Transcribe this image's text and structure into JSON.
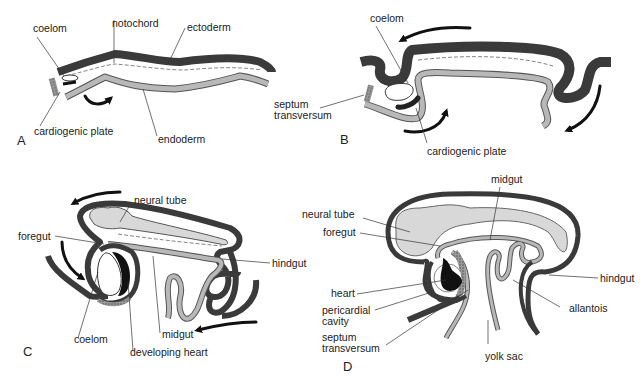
{
  "diagram": {
    "colors": {
      "ectoderm": "#3a3a3a",
      "endoderm_fill": "#b8b8b8",
      "neural_tube_fill": "#d8d8d8",
      "heart": "#111111",
      "background": "#ffffff"
    },
    "panels": [
      {
        "id": "A",
        "letter": "A",
        "labels": {
          "coelom": "coelom",
          "notochord": "notochord",
          "ectoderm": "ectoderm",
          "cardiogenic_plate": "cardiogenic plate",
          "endoderm": "endoderm"
        }
      },
      {
        "id": "B",
        "letter": "B",
        "labels": {
          "coelom": "coelom",
          "septum_1": "septum",
          "septum_2": "transversum",
          "cardiogenic_plate": "cardiogenic plate"
        }
      },
      {
        "id": "C",
        "letter": "C",
        "labels": {
          "neural_tube": "neural tube",
          "foregut": "foregut",
          "hindgut": "hindgut",
          "coelom": "coelom",
          "midgut": "midgut",
          "developing_heart": "developing heart"
        }
      },
      {
        "id": "D",
        "letter": "D",
        "labels": {
          "midgut": "midgut",
          "neural_tube": "neural tube",
          "foregut": "foregut",
          "hindgut": "hindgut",
          "heart": "heart",
          "pericardial_1": "pericardial",
          "pericardial_2": "cavity",
          "allantois": "allantois",
          "septum_1": "septum",
          "septum_2": "transversum",
          "yolk_sac": "yolk sac"
        }
      }
    ]
  }
}
